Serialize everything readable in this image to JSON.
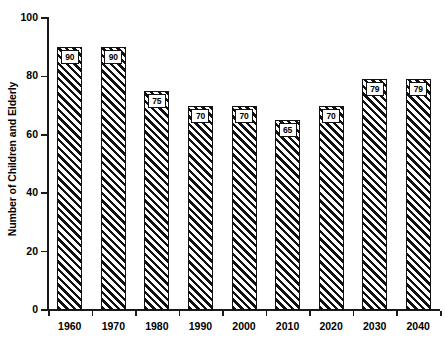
{
  "chart_data": {
    "type": "bar",
    "title": "",
    "subtitle": "",
    "xlabel": "",
    "ylabel": "Number of Children and Elderly",
    "categories": [
      "1960",
      "1970",
      "1980",
      "1990",
      "2000",
      "2010",
      "2020",
      "2030",
      "2040"
    ],
    "values": [
      90,
      90,
      75,
      70,
      70,
      65,
      70,
      79,
      79
    ],
    "data_labels": [
      "90",
      "90",
      "75",
      "70",
      "70",
      "65",
      "70",
      "79",
      "79"
    ],
    "ylim": [
      0,
      100
    ],
    "y_ticks": [
      0,
      20,
      40,
      60,
      80,
      100
    ],
    "y_tick_labels": [
      "0",
      "20",
      "40",
      "60",
      "80",
      "100"
    ],
    "x_tick_labels": [
      "1960",
      "1970",
      "1980",
      "1990",
      "2000",
      "2010",
      "2020",
      "2030",
      "2040"
    ],
    "grid": false,
    "legend": null,
    "legend_position": "none",
    "bar_fill": "diagonal-hatch",
    "bar_color": "#111111",
    "background_color": "#ffffff"
  }
}
